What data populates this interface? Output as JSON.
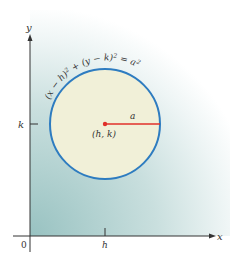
{
  "diagram": {
    "equation": "(x − h)² + (y − k)² = a²",
    "eq_parts": [
      "(x − h)",
      "2",
      " + (y − k)",
      "2",
      " = a",
      "2"
    ],
    "center_label": "(h, k)",
    "radius_label": "a",
    "axes": {
      "x_label": "x",
      "y_label": "y",
      "origin_label": "0",
      "x_tick_label": "h",
      "y_tick_label": "k"
    },
    "colors": {
      "circle_stroke": "#2e7cc0",
      "circle_fill": "#f1f0d8",
      "radius_line": "#e0302a",
      "background_shade": "#a9cccb",
      "axis": "#333333"
    }
  }
}
